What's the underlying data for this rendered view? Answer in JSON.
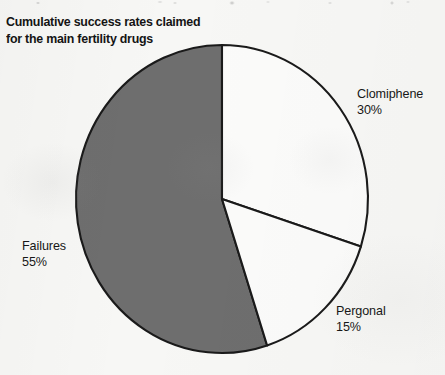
{
  "title": {
    "line1": "Cumulative success rates claimed",
    "line2": "for the main fertility drugs"
  },
  "labels": {
    "clomiphene": {
      "name": "Clomiphene",
      "value": "30%"
    },
    "pergonal": {
      "name": "Pergonal",
      "value": "15%"
    },
    "failures": {
      "name": "Failures",
      "value": "55%"
    }
  },
  "colors": {
    "background": "#f7f7f5",
    "slice_white": "#fbfbfa",
    "slice_gray": "#6e6e6e",
    "outline": "#1a1a1a",
    "text": "#141414"
  },
  "chart_data": {
    "type": "pie",
    "title": "Cumulative success rates claimed for the main fertility drugs",
    "xlabel": "",
    "ylabel": "",
    "categories": [
      "Clomiphene",
      "Pergonal",
      "Failures"
    ],
    "values": [
      30,
      15,
      55
    ],
    "value_labels": [
      "30%",
      "15%",
      "55%"
    ],
    "units": "percent",
    "total": 100,
    "start_angle_deg": 0,
    "direction": "clockwise",
    "slice_colors": [
      "#fbfbfa",
      "#fbfbfa",
      "#6e6e6e"
    ],
    "legend": "none",
    "labels_position": "outside",
    "grid": false,
    "geometry": {
      "center_x": 222,
      "center_y": 199,
      "radius_x": 146,
      "radius_y": 154
    }
  }
}
